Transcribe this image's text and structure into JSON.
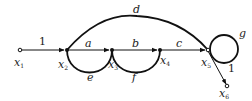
{
  "diagram": {
    "type": "signal-flow-graph",
    "nodes": [
      {
        "id": "x1",
        "label": "x",
        "sub": "1"
      },
      {
        "id": "x2",
        "label": "x",
        "sub": "2"
      },
      {
        "id": "x3",
        "label": "x",
        "sub": "3"
      },
      {
        "id": "x4",
        "label": "x",
        "sub": "4"
      },
      {
        "id": "x5",
        "label": "x",
        "sub": "5"
      },
      {
        "id": "x6",
        "label": "x",
        "sub": "6"
      }
    ],
    "edges": [
      {
        "from": "x1",
        "to": "x2",
        "gain": "1"
      },
      {
        "from": "x2",
        "to": "x3",
        "gain": "a"
      },
      {
        "from": "x3",
        "to": "x4",
        "gain": "b"
      },
      {
        "from": "x4",
        "to": "x5",
        "gain": "c"
      },
      {
        "from": "x2",
        "to": "x5",
        "gain": "d"
      },
      {
        "from": "x3",
        "to": "x2",
        "gain": "e"
      },
      {
        "from": "x4",
        "to": "x3",
        "gain": "f"
      },
      {
        "from": "x5",
        "to": "x5",
        "gain": "g"
      },
      {
        "from": "x5",
        "to": "x6",
        "gain": "1"
      }
    ]
  }
}
